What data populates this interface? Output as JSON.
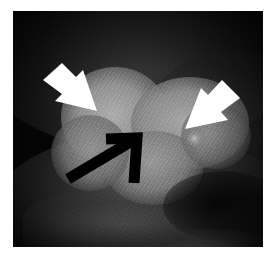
{
  "figure": {
    "modality_appearance": "grayscale tomographic slice",
    "page_background": "#ffffff",
    "plate": {
      "background": "#050505",
      "left": 13,
      "top": 11,
      "width": 250,
      "height": 236
    }
  },
  "annotations": [
    {
      "id": "arrow-white-left",
      "label": "white solid arrow, upper left",
      "color": "#ffffff",
      "points_toward": "down-right",
      "tip_x": 83,
      "tip_y": 102
    },
    {
      "id": "arrow-white-right",
      "label": "white solid arrow, upper right",
      "color": "#ffffff",
      "points_toward": "down-left",
      "tip_x": 172,
      "tip_y": 120
    },
    {
      "id": "arrow-black-open",
      "label": "black open arrow, lower left",
      "color": "#000000",
      "points_toward": "up-right",
      "tip_x": 124,
      "tip_y": 126
    }
  ],
  "structures": [
    {
      "id": "lobe-left",
      "label": "bright lobular mass, left"
    },
    {
      "id": "lobe-right",
      "label": "bright lobular mass, right"
    },
    {
      "id": "lobe-lower-mid",
      "label": "bright lobular mass, inferior middle"
    },
    {
      "id": "lobe-left-inf",
      "label": "bright lobular mass, inferior left"
    },
    {
      "id": "lobe-right-tail",
      "label": "bright tissue, right tail"
    },
    {
      "id": "bright-dot",
      "label": "small bright focus"
    },
    {
      "id": "low-band",
      "label": "inferior soft tissue band"
    },
    {
      "id": "dark-cleft",
      "label": "dark cleft, lower right"
    },
    {
      "id": "bottom-glow",
      "label": "bright tissue, bottom right"
    }
  ]
}
